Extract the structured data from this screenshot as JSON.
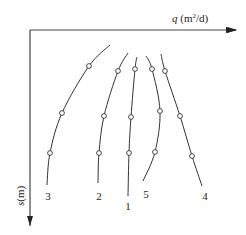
{
  "axes": {
    "x_label_var": "q",
    "x_label_unit": " (m",
    "x_label_sup": "2",
    "x_label_end": "/d)",
    "y_label_var": "s",
    "y_label_unit": "(m)"
  },
  "curves": [
    {
      "id": "3",
      "label": "3",
      "points": [
        [
          110,
          45
        ],
        [
          89,
          66
        ],
        [
          62,
          113
        ],
        [
          50,
          153
        ],
        [
          47,
          185
        ]
      ],
      "markers": [
        [
          89,
          66
        ],
        [
          62,
          113
        ],
        [
          50,
          153
        ]
      ],
      "label_pos": [
        48,
        200
      ]
    },
    {
      "id": "2",
      "label": "2",
      "points": [
        [
          128,
          53
        ],
        [
          118,
          71
        ],
        [
          104,
          116
        ],
        [
          99,
          153
        ],
        [
          98,
          183
        ]
      ],
      "markers": [
        [
          118,
          71
        ],
        [
          104,
          116
        ],
        [
          99,
          153
        ]
      ],
      "label_pos": [
        99,
        200
      ]
    },
    {
      "id": "1",
      "label": "1",
      "points": [
        [
          137,
          57
        ],
        [
          135,
          69
        ],
        [
          131,
          117
        ],
        [
          129,
          153
        ],
        [
          128,
          196
        ]
      ],
      "markers": [
        [
          135,
          69
        ],
        [
          131,
          117
        ],
        [
          129,
          153
        ]
      ],
      "label_pos": [
        128,
        210
      ]
    },
    {
      "id": "5",
      "label": "5",
      "points": [
        [
          146,
          56
        ],
        [
          152,
          69
        ],
        [
          160,
          111
        ],
        [
          155,
          152
        ],
        [
          143,
          181
        ]
      ],
      "markers": [
        [
          152,
          69
        ],
        [
          160,
          111
        ],
        [
          155,
          152
        ]
      ],
      "label_pos": [
        146,
        198
      ]
    },
    {
      "id": "4",
      "label": "4",
      "points": [
        [
          161,
          54
        ],
        [
          165,
          71
        ],
        [
          180,
          116
        ],
        [
          192,
          156
        ],
        [
          202,
          186
        ]
      ],
      "markers": [
        [
          165,
          71
        ],
        [
          180,
          116
        ],
        [
          192,
          156
        ]
      ],
      "label_pos": [
        205,
        200
      ]
    }
  ],
  "colors": {
    "line": "#333333",
    "marker_fill": "#ffffff",
    "axis": "#444444"
  }
}
